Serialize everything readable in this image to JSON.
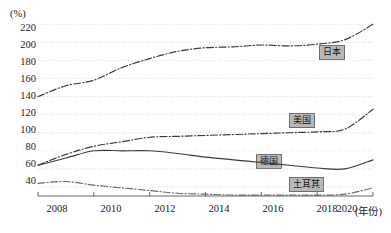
{
  "chart_data": {
    "type": "line",
    "title": "",
    "subtitle": "",
    "ylabel": "(%)",
    "xlabel": "(年份)",
    "x": [
      2008,
      2009,
      2010,
      2011,
      2012,
      2013,
      2014,
      2015,
      2016,
      2017,
      2018,
      2019,
      2020
    ],
    "xticks": [
      "2008",
      "2010",
      "2012",
      "2014",
      "2016",
      "2018",
      "2020"
    ],
    "xtick_values": [
      2008,
      2010,
      2012,
      2014,
      2016,
      2018,
      2020
    ],
    "yticks": [
      "40",
      "60",
      "80",
      "100",
      "120",
      "140",
      "160",
      "180",
      "200",
      "220"
    ],
    "ytick_values": [
      40,
      60,
      80,
      100,
      120,
      140,
      160,
      180,
      200,
      220
    ],
    "ylim": [
      30,
      228
    ],
    "xlim": [
      2008,
      2020
    ],
    "grid": true,
    "grid_style": "dotted-horizontal",
    "legend_position": "inline-end-of-series",
    "series": [
      {
        "name": "日本",
        "label": "日本",
        "style": "dash-dot",
        "color": "#3a3a3a",
        "values": [
          140,
          152,
          158,
          172,
          182,
          190,
          194,
          195,
          197,
          196,
          198,
          203,
          220
        ]
      },
      {
        "name": "美国",
        "label": "美国",
        "style": "dash-dot",
        "color": "#3a3a3a",
        "values": [
          64,
          76,
          85,
          90,
          95,
          96,
          97,
          98,
          99,
          100,
          101,
          104,
          126
        ]
      },
      {
        "name": "德国",
        "label": "德国",
        "style": "solid",
        "color": "#3a3a3a",
        "values": [
          64,
          72,
          80,
          80,
          80,
          77,
          73,
          70,
          67,
          64,
          61,
          60,
          70
        ]
      },
      {
        "name": "土耳其",
        "label": "土耳其",
        "style": "dash-dot",
        "color": "#6a6a6a",
        "values": [
          44,
          46,
          42,
          39,
          36,
          33,
          32,
          31,
          31,
          31,
          31,
          32,
          39
        ]
      }
    ],
    "annotations": [
      {
        "text": "日本",
        "x": 2019.3,
        "y": 196
      },
      {
        "text": "美国",
        "x": 2018.1,
        "y": 112
      },
      {
        "text": "德国",
        "x": 2017.4,
        "y": 66
      },
      {
        "text": "土耳其",
        "x": 2018.4,
        "y": 42
      }
    ]
  },
  "axes": {
    "y_unit": "(%)",
    "x_unit": "(年份)",
    "y_labels": [
      "220",
      "200",
      "180",
      "160",
      "140",
      "120",
      "100",
      "80",
      "60",
      "40"
    ],
    "x_labels": [
      "2008",
      "2010",
      "2012",
      "2014",
      "2016",
      "2018",
      "2020"
    ]
  },
  "labels": {
    "japan": "日本",
    "usa": "美国",
    "germany": "德国",
    "turkey": "土耳其"
  }
}
